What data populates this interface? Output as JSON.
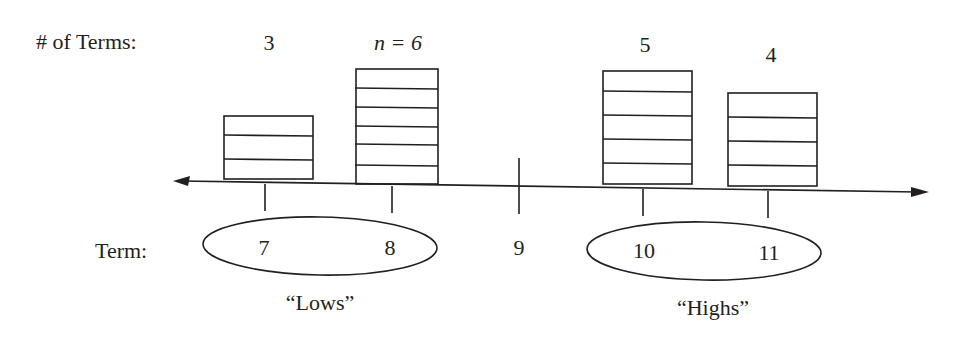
{
  "diagram": {
    "row_labels": {
      "count": "# of Terms:",
      "term": "Term:"
    },
    "columns": [
      {
        "term": "7",
        "count_label": "3",
        "count": 3,
        "italic": false
      },
      {
        "term": "8",
        "count_label": "n = 6",
        "count": 6,
        "italic": true
      },
      {
        "term": "9",
        "count_label": "",
        "count": 0,
        "italic": false
      },
      {
        "term": "10",
        "count_label": "5",
        "count": 5,
        "italic": false
      },
      {
        "term": "11",
        "count_label": "4",
        "count": 4,
        "italic": false
      }
    ],
    "groups": [
      {
        "label": "“Lows”",
        "terms": [
          "7",
          "8"
        ]
      },
      {
        "label": "“Highs”",
        "terms": [
          "10",
          "11"
        ]
      }
    ],
    "colors": {
      "ink": "#231f20",
      "background": "#ffffff"
    }
  }
}
